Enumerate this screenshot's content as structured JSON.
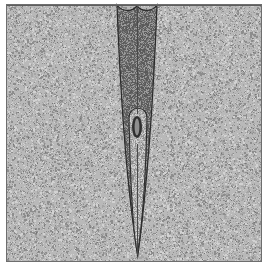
{
  "figure": {
    "domain": "scientific-illustration",
    "title": "Cross-section of tapering wedge intrusion in speckled matrix",
    "canvas": {
      "width": 274,
      "height": 270
    },
    "background_color": "#ffffff",
    "matrix": {
      "name": "host-matrix",
      "description": "Speckled light-gray granular medium filling the framed panel",
      "fill_color": "#b9b9b9",
      "speckle_dark_color": "#8d8d8d",
      "speckle_light_color": "#d2d2d2",
      "frame": {
        "x": 6,
        "y": 4,
        "width": 256,
        "height": 258
      },
      "border_color": "#6e6e6e",
      "border_width": 1
    },
    "wedge": {
      "name": "dark-wedge-body",
      "description": "Dark triangular wedge descending from the top surface and tapering to a point",
      "fill_color": "#7a7a7a",
      "speckle_dark_color": "#5a5a5a",
      "speckle_light_color": "#9a9a9a",
      "outline_color": "#2b2b2b",
      "outline_width": 1.2,
      "top_left_x": 117,
      "top_right_x": 157,
      "top_y": 5,
      "tip_x": 137,
      "tip_y": 256,
      "notch_depth": 7,
      "notch_center_x": 137
    },
    "inner_channel": {
      "name": "light-inner-channel",
      "description": "Lighter rounded-top inner channel inside the wedge, continuing down to the tip",
      "fill_color": "#b5b5b5",
      "outline_color": "#2b2b2b",
      "outline_width": 1.1,
      "top_y": 110,
      "top_left_x": 129,
      "top_right_x": 147,
      "tip_x": 137,
      "tip_y": 254
    },
    "inclusion": {
      "name": "dark-oval-inclusion",
      "description": "Small dark elliptical inclusion suspended inside the light channel",
      "center_x": 137,
      "center_y": 127,
      "radius_x": 5,
      "radius_y": 11,
      "ring_color": "#2f2f2f",
      "core_color": "#8e8e8e",
      "ring_thickness": 2.6
    },
    "center_seam": {
      "name": "central-seam-line",
      "description": "Thin vertical seam running down the axis of the wedge",
      "x": 137,
      "top_y": 6,
      "bottom_y": 255,
      "color": "#4a4a4a",
      "width": 1
    },
    "top_surface": {
      "name": "top-surface-line",
      "description": "Dark horizontal surface line across the top of the panel",
      "y": 5,
      "color": "#5d5d5d",
      "width": 1
    }
  }
}
